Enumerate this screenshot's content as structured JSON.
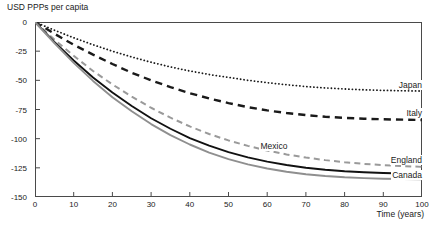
{
  "chart_data": {
    "type": "line",
    "title": "",
    "xlabel": "Time (years)",
    "ylabel": "USD PPPs per capita",
    "xlim": [
      0,
      100
    ],
    "ylim": [
      -150,
      0
    ],
    "xticks": [
      0,
      10,
      20,
      30,
      40,
      50,
      60,
      70,
      80,
      90,
      100
    ],
    "yticks": [
      0,
      -25,
      -50,
      -75,
      -100,
      -125,
      -150
    ],
    "xtick_labels": [
      "0",
      "10",
      "20",
      "30",
      "40",
      "50",
      "60",
      "70",
      "80",
      "90",
      "100"
    ],
    "ytick_labels": [
      "0",
      "-25",
      "-50",
      "-75",
      "-100",
      "-125",
      "-150"
    ],
    "grid": false,
    "legend_position": "inline-right-end-labels",
    "x": [
      0,
      5,
      10,
      15,
      20,
      25,
      30,
      35,
      40,
      45,
      50,
      55,
      60,
      65,
      70,
      75,
      80,
      85,
      90,
      95,
      100
    ],
    "series": [
      {
        "name": "Japan",
        "color": "#1a1a1a",
        "style": "dotted",
        "width": 1.8,
        "label_x": 100,
        "label_y": -59,
        "values": [
          0,
          -7,
          -13.5,
          -19.5,
          -25,
          -30,
          -34.5,
          -38.5,
          -42,
          -45,
          -47.5,
          -50,
          -52,
          -53.8,
          -55.3,
          -56.5,
          -57.4,
          -58.1,
          -58.6,
          -58.9,
          -59.2
        ]
      },
      {
        "name": "Italy",
        "color": "#1a1a1a",
        "style": "dashed",
        "width": 2.4,
        "label_x": 100,
        "label_y": -83,
        "values": [
          0,
          -10,
          -19.5,
          -28,
          -36,
          -43.5,
          -50,
          -55.8,
          -61,
          -65.5,
          -69.5,
          -73,
          -75.8,
          -78,
          -79.8,
          -81.2,
          -82.2,
          -82.9,
          -83.4,
          -83.7,
          -84
        ]
      },
      {
        "name": "Mexico",
        "color": "#9a9a9a",
        "style": "dashed",
        "width": 2.0,
        "label_x": 58,
        "label_y": -111,
        "values": [
          0,
          -15,
          -29,
          -42,
          -53.5,
          -64,
          -73.5,
          -82,
          -89.5,
          -96,
          -101.5,
          -106.2,
          -110.2,
          -113.5,
          -116.2,
          -118.4,
          -120.2,
          -121.6,
          -122.7,
          -123.5,
          -124.2
        ]
      },
      {
        "name": "England",
        "color": "#111111",
        "style": "solid",
        "width": 1.9,
        "label_x": 100,
        "label_y": -123,
        "values": [
          0,
          -17,
          -33,
          -47.5,
          -60.5,
          -72,
          -82.5,
          -91.5,
          -99.5,
          -106,
          -111.5,
          -116,
          -119.7,
          -122.6,
          -124.9,
          -126.6,
          -127.9,
          -128.8,
          -129.4,
          -129.8,
          -130.1
        ]
      },
      {
        "name": "Canada",
        "color": "#8f8f8f",
        "style": "solid",
        "width": 1.9,
        "label_x": 100,
        "label_y": -136,
        "values": [
          0,
          -18,
          -35,
          -50.5,
          -64.5,
          -76.5,
          -87.5,
          -97,
          -105,
          -112,
          -117.5,
          -122,
          -125.6,
          -128.4,
          -130.5,
          -132,
          -133.1,
          -133.8,
          -134.3,
          -134.6,
          -134.8
        ]
      }
    ]
  },
  "labels": {
    "y_axis_title": "USD PPPs per capita",
    "x_axis_title": "Time (years)"
  },
  "caption": ""
}
